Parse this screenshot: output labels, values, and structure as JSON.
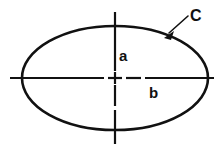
{
  "figure": {
    "type": "ellipse-dimension-diagram",
    "background_color": "#ffffff",
    "stroke_color": "#111111",
    "canvas": {
      "width": 222,
      "height": 155
    }
  },
  "ellipse": {
    "name": "ellipse-outline",
    "center_x": 115,
    "center_y": 78,
    "semi_axis_vertical": 52,
    "semi_axis_horizontal": 93,
    "stroke_width": 2.6
  },
  "axes": {
    "vertical": {
      "name": "vertical-centerline",
      "x": 115,
      "top": 12,
      "bottom": 144,
      "stroke_width": 2.2
    },
    "horizontal": {
      "name": "horizontal-centerline",
      "y": 78,
      "left": 10,
      "right": 214,
      "stroke_width": 2.2
    },
    "center_mark": {
      "name": "center-cross-mark",
      "x": 115,
      "y": 78
    }
  },
  "leader": {
    "name": "leader-line-c",
    "tail_x": 188,
    "tail_y": 16,
    "tip_x": 165,
    "tip_y": 37
  },
  "labels": {
    "semi_minor": {
      "text": "a",
      "x": 119,
      "y": 61
    },
    "semi_major": {
      "text": "b",
      "x": 149,
      "y": 98
    },
    "curve": {
      "text": "C",
      "x": 190,
      "y": 21
    }
  }
}
